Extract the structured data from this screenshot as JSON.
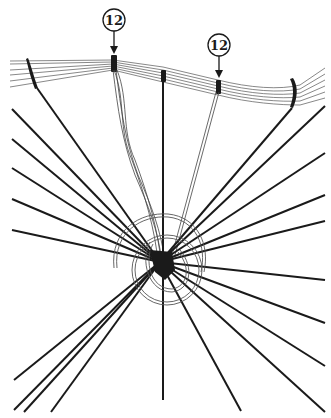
{
  "diagram": {
    "type": "technical-illustration",
    "callouts": [
      {
        "label": "12",
        "x": 114,
        "y": 20
      },
      {
        "label": "12",
        "x": 219,
        "y": 45
      }
    ],
    "colors": {
      "ink": "#1a1a1a",
      "wire": "#555555",
      "background": "#ffffff"
    },
    "hub": {
      "x": 160,
      "y": 262
    }
  }
}
